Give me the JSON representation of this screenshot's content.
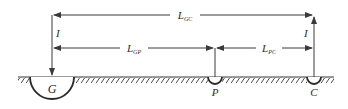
{
  "diagram": {
    "type": "fall-of-potential ground resistance test",
    "colors": {
      "line": "#3a3a3a",
      "text": "#2b2b2b",
      "background": "#ffffff"
    },
    "electrodes": [
      {
        "id": "G",
        "label": "G",
        "description": "ground electrode under test (large hemisphere)"
      },
      {
        "id": "P",
        "label": "P",
        "description": "potential probe (small hemisphere)"
      },
      {
        "id": "C",
        "label": "C",
        "description": "current probe (small hemisphere)"
      }
    ],
    "currents": {
      "left": {
        "label": "I",
        "direction": "down into G"
      },
      "right": {
        "label": "I",
        "direction": "up out of C"
      }
    },
    "distances": {
      "gc": {
        "main": "L",
        "sub": "GC",
        "from": "G",
        "to": "C"
      },
      "gp": {
        "main": "L",
        "sub": "GP",
        "from": "G",
        "to": "P"
      },
      "pc": {
        "main": "L",
        "sub": "PC",
        "from": "P",
        "to": "C"
      }
    }
  }
}
